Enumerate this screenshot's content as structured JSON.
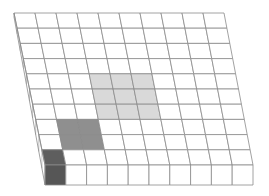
{
  "diagram": {
    "title": "",
    "type": "3d-grid-slab",
    "grid": {
      "rows": 10,
      "cols": 10,
      "top_y": 13,
      "bottom_y": 165,
      "top_left_x": 14,
      "bottom_left_x": 45,
      "col_spacing_top": 21,
      "col_spacing_bottom": 20.8,
      "thickness": 20
    },
    "colors": {
      "background": "#ffffff",
      "line": "#8a8a8a",
      "cell": "#ffffff",
      "light_block": "#d9d9d9",
      "medium_block": "#8f8f8f",
      "dark_block": "#5e5e5e",
      "dark_block_front": "#565656"
    },
    "blocks": [
      {
        "name": "light-block",
        "shade": "light_block",
        "row_start": 4,
        "row_end": 6,
        "col_start": 3,
        "col_end": 5
      },
      {
        "name": "medium-block",
        "shade": "medium_block",
        "row_start": 7,
        "row_end": 8,
        "col_start": 1,
        "col_end": 2
      },
      {
        "name": "dark-block",
        "shade": "dark_block",
        "row_start": 9,
        "row_end": 9,
        "col_start": 0,
        "col_end": 0,
        "front_face": true
      }
    ]
  }
}
